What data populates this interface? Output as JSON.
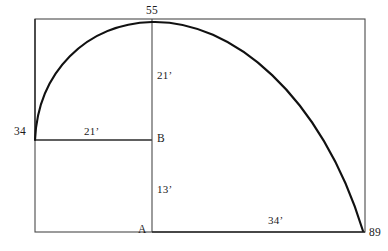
{
  "figure": {
    "type": "geometry-diagram",
    "stroke_color": "#2b2b2b",
    "curve_color": "#111111",
    "background_color": "#ffffff",
    "outer_rect": {
      "x1": 35,
      "y1": 19,
      "x2": 365,
      "y2": 232
    },
    "inner_rect": {
      "x1": 35,
      "y1": 19,
      "x2": 152,
      "y2": 140
    },
    "vertical_line": {
      "x": 152,
      "y_top": 19,
      "y_bottom": 232
    },
    "bottom_line": {
      "y": 232,
      "x1": 152,
      "x2": 365
    },
    "curve": {
      "start": {
        "x": 35,
        "y": 140
      },
      "apex": {
        "x": 152,
        "y": 22
      },
      "end": {
        "x": 365,
        "y": 232
      }
    },
    "labels": {
      "top_node": "55",
      "left_node": "34",
      "bottom_right_node": "89",
      "vertex_a": "A",
      "vertex_b": "B",
      "dim_vertical_upper": "21’",
      "dim_vertical_lower": "13’",
      "dim_horizontal_upper": "21’",
      "dim_horizontal_lower": "34’"
    }
  }
}
